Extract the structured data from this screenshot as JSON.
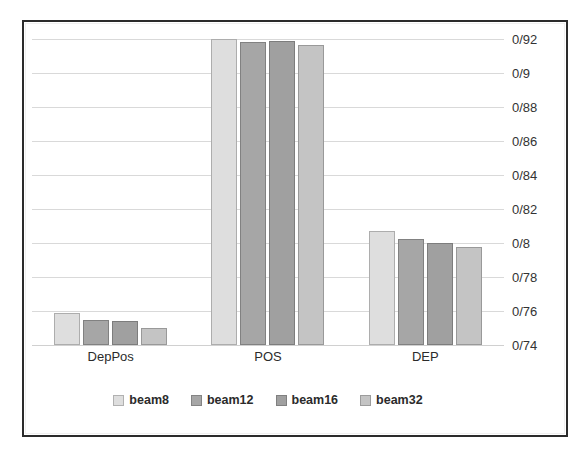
{
  "chart_data": {
    "type": "bar",
    "title": "",
    "xlabel": "",
    "ylabel": "",
    "categories": [
      "DepPos",
      "POS",
      "DEP"
    ],
    "series": [
      {
        "name": "beam8",
        "color": "#dedede",
        "values": [
          0.759,
          0.92,
          0.807
        ]
      },
      {
        "name": "beam12",
        "color": "#a6a6a6",
        "values": [
          0.755,
          0.9185,
          0.8025
        ]
      },
      {
        "name": "beam16",
        "color": "#a0a0a0",
        "values": [
          0.754,
          0.919,
          0.8
        ]
      },
      {
        "name": "beam32",
        "color": "#c4c4c4",
        "values": [
          0.75,
          0.9165,
          0.7975
        ]
      }
    ],
    "ylim": [
      0.74,
      0.92
    ],
    "ytick_values": [
      0.92,
      0.9,
      0.88,
      0.86,
      0.84,
      0.82,
      0.8,
      0.78,
      0.76,
      0.74
    ],
    "ytick_labels": [
      "0/92",
      "0/9",
      "0/88",
      "0/86",
      "0/84",
      "0/82",
      "0/8",
      "0/78",
      "0/76",
      "0/74"
    ],
    "grid": true,
    "legend_position": "bottom",
    "y_axis_side": "right",
    "decimal_separator": "/"
  },
  "frame": {
    "border_color": "#2b2b2b",
    "grid_color": "#d9d9d9",
    "background": "#ffffff"
  }
}
